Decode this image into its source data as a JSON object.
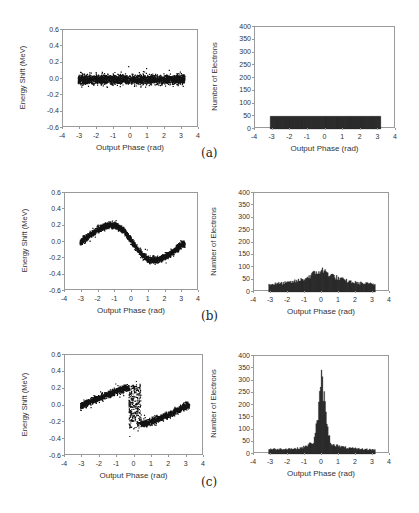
{
  "captions": [
    "(a)",
    "(b)",
    "(c)"
  ],
  "chart_data": [
    {
      "id": "a-left",
      "type": "scatter",
      "title": "",
      "xlabel": "Output Phase (rad)",
      "ylabel": "Energy Shift (MeV)",
      "xlim": [
        -4,
        4
      ],
      "ylim": [
        -0.6,
        0.6
      ],
      "xticks": [
        "-4",
        "-3",
        "-2",
        "-1",
        "0",
        "1",
        "2",
        "3",
        "4"
      ],
      "yticks": [
        "0.6",
        "0.4",
        "0.2",
        "0.0",
        "-0.2",
        "-0.4",
        "-0.6"
      ],
      "grid": false,
      "description": "Uniform band of electrons spanning phase -3.14 to 3.14 with energy shift ~0 +/- 0.05 MeV",
      "series": [
        {
          "name": "electrons",
          "shape": "band",
          "x_range": [
            -3.14,
            3.14
          ],
          "center": 0.0,
          "half_width": 0.05
        }
      ]
    },
    {
      "id": "a-right",
      "type": "bar",
      "title": "",
      "xlabel": "Output Phase (rad)",
      "ylabel": "Number of Electrons",
      "xlim": [
        -4,
        4
      ],
      "ylim": [
        0,
        400
      ],
      "xticks": [
        "-4",
        "-3",
        "-2",
        "-1",
        "0",
        "1",
        "2",
        "3",
        "4"
      ],
      "yticks": [
        "400",
        "350",
        "300",
        "250",
        "200",
        "150",
        "100",
        "50",
        "0"
      ],
      "grid": false,
      "description": "Flat histogram of ~50 electrons per bin from -3.14 to 3.14",
      "x": [
        -3.0,
        -2.5,
        -2.0,
        -1.5,
        -1.0,
        -0.5,
        0.0,
        0.5,
        1.0,
        1.5,
        2.0,
        2.5,
        3.0
      ],
      "values": [
        50,
        50,
        50,
        50,
        50,
        50,
        50,
        50,
        50,
        50,
        50,
        50,
        50
      ]
    },
    {
      "id": "b-left",
      "type": "scatter",
      "title": "",
      "xlabel": "Output Phase (rad)",
      "ylabel": "Energy Shift (MeV)",
      "xlim": [
        -4,
        4
      ],
      "ylim": [
        -0.6,
        0.6
      ],
      "xticks": [
        "-4",
        "-3",
        "-2",
        "-1",
        "0",
        "1",
        "2",
        "3",
        "4"
      ],
      "yticks": [
        "0.6",
        "0.4",
        "0.2",
        "0.0",
        "-0.2",
        "-0.4",
        "-0.6"
      ],
      "grid": false,
      "description": "Sinusoidal band: peaks ~+0.22 MeV near phase -1.1, troughs ~-0.22 MeV near phase 1.1",
      "x": [
        -3.1,
        -2.5,
        -2.0,
        -1.5,
        -1.0,
        -0.5,
        0.0,
        0.5,
        1.0,
        1.5,
        2.0,
        2.5,
        3.0
      ],
      "values": [
        0.0,
        0.1,
        0.17,
        0.21,
        0.21,
        0.14,
        0.0,
        -0.14,
        -0.21,
        -0.21,
        -0.17,
        -0.1,
        -0.02
      ]
    },
    {
      "id": "b-right",
      "type": "bar",
      "title": "",
      "xlabel": "Output Phase (rad)",
      "ylabel": "Number of Electrons",
      "xlim": [
        -4,
        4
      ],
      "ylim": [
        0,
        400
      ],
      "xticks": [
        "-4",
        "-3",
        "-2",
        "-1",
        "0",
        "1",
        "2",
        "3",
        "4"
      ],
      "yticks": [
        "400",
        "350",
        "300",
        "250",
        "200",
        "150",
        "100",
        "50",
        "0"
      ],
      "grid": false,
      "description": "Broad bunching peak ~90 near phase 0, baseline ~30-40",
      "x": [
        -3.0,
        -2.5,
        -2.0,
        -1.5,
        -1.0,
        -0.5,
        0.0,
        0.5,
        1.0,
        1.5,
        2.0,
        2.5,
        3.0
      ],
      "values": [
        32,
        35,
        38,
        45,
        55,
        75,
        90,
        72,
        55,
        45,
        38,
        35,
        32
      ]
    },
    {
      "id": "c-left",
      "type": "scatter",
      "title": "",
      "xlabel": "Output Phase (rad)",
      "ylabel": "Energy Shift (MeV)",
      "xlim": [
        -4,
        4
      ],
      "ylim": [
        -0.6,
        0.6
      ],
      "xticks": [
        "-4",
        "-3",
        "-2",
        "-1",
        "0",
        "1",
        "2",
        "3",
        "4"
      ],
      "yticks": [
        "0.6",
        "0.4",
        "0.2",
        "0.0",
        "-0.2",
        "-0.4",
        "-0.6"
      ],
      "grid": false,
      "description": "Overbunched S-shaped band: rises from 0 at -3.1 to ~+0.22 near -0.3, drops vertically near 0 to ~-0.22, rises back to 0 at 3.1",
      "x": [
        -3.1,
        -2.5,
        -2.0,
        -1.5,
        -1.0,
        -0.5,
        -0.2,
        0.0,
        0.2,
        0.5,
        1.0,
        1.5,
        2.0,
        2.5,
        3.0
      ],
      "values": [
        0.0,
        0.06,
        0.1,
        0.14,
        0.18,
        0.21,
        0.2,
        0.0,
        -0.2,
        -0.21,
        -0.18,
        -0.14,
        -0.1,
        -0.05,
        0.01
      ]
    },
    {
      "id": "c-right",
      "type": "bar",
      "title": "",
      "xlabel": "Output Phase (rad)",
      "ylabel": "Number of Electrons",
      "xlim": [
        -4,
        4
      ],
      "ylim": [
        0,
        400
      ],
      "xticks": [
        "-4",
        "-3",
        "-2",
        "-1",
        "0",
        "1",
        "2",
        "3",
        "4"
      ],
      "yticks": [
        "400",
        "350",
        "300",
        "250",
        "200",
        "150",
        "100",
        "50",
        "0"
      ],
      "grid": false,
      "description": "Sharp bunching peak ~320 at phase 0, baseline ~20",
      "x": [
        -3.0,
        -2.5,
        -2.0,
        -1.5,
        -1.0,
        -0.5,
        -0.25,
        0.0,
        0.25,
        0.5,
        1.0,
        1.5,
        2.0,
        2.5,
        3.0
      ],
      "values": [
        20,
        20,
        22,
        22,
        30,
        50,
        150,
        320,
        150,
        45,
        32,
        25,
        22,
        20,
        18
      ]
    }
  ]
}
